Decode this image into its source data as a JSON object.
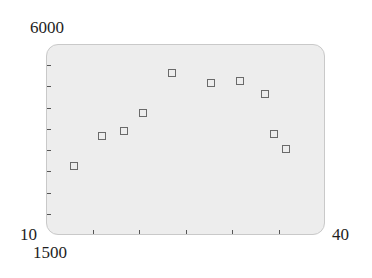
{
  "chart_data": {
    "type": "scatter",
    "title": "",
    "xlabel": "",
    "ylabel": "",
    "xlim": [
      10,
      40
    ],
    "ylim": [
      1500,
      6000
    ],
    "x_tick_labels": [
      "10",
      "40"
    ],
    "y_tick_labels": [
      "1500",
      "6000"
    ],
    "x_minor_ticks": [
      15,
      20,
      25,
      30,
      35
    ],
    "y_minor_ticks": [
      2000,
      2500,
      3000,
      3500,
      4000,
      4500,
      5000,
      5500
    ],
    "grid": false,
    "legend": null,
    "marker": "hollow-square",
    "marker_color": "#6a6a6a",
    "plot_background": "#ededed",
    "series": [
      {
        "name": "data",
        "x": [
          13.0,
          16.0,
          18.4,
          20.4,
          23.5,
          27.7,
          30.9,
          33.6,
          34.5,
          35.8
        ],
        "y": [
          3130,
          3840,
          3940,
          4370,
          5320,
          5070,
          5120,
          4820,
          3870,
          3530
        ]
      }
    ]
  },
  "labels": {
    "y_max": "6000",
    "x_min": "10",
    "y_min": "1500",
    "x_max": "40"
  }
}
